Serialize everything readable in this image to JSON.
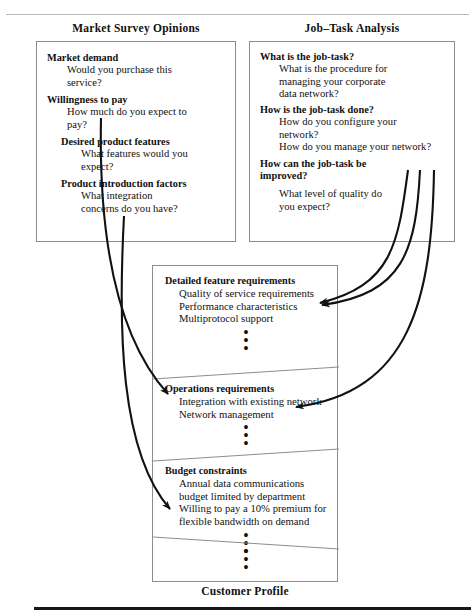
{
  "diagram": {
    "bottom_caption": "Customer Profile",
    "columns": {
      "left_title": "Market Survey Opinions",
      "right_title": "Job–Task Analysis"
    },
    "market_survey": {
      "groups": [
        {
          "heading": "Market demand",
          "detail": "Would you purchase this\nservice?"
        },
        {
          "heading": "Willingness to pay",
          "detail": "How much do you expect to\npay?"
        },
        {
          "heading": "Desired product features",
          "detail": "What features would you\nexpect?"
        },
        {
          "heading": "Product introduction factors",
          "detail": "What integration\nconcerns do you have?"
        }
      ]
    },
    "job_task_analysis": {
      "groups": [
        {
          "heading": "What is the job-task?",
          "detail": "What is the procedure for\nmanaging your corporate\ndata network?"
        },
        {
          "heading": "How is the job-task done?",
          "detail": "How do you configure your\nnetwork?\nHow do you manage your network?"
        },
        {
          "heading": "How can the job-task be\nimproved?",
          "detail": "What level of quality do\nyou expect?"
        }
      ]
    },
    "customer_profile": {
      "sections": [
        {
          "heading": "Detailed feature requirements",
          "items": "Quality of service requirements\nPerformance characteristics\nMultiprotocol support",
          "ellipsis": "•••"
        },
        {
          "heading": "Operations requirements",
          "items": "Integration with existing network\nNetwork management",
          "ellipsis": "•••"
        },
        {
          "heading": "Budget constraints",
          "items": "Annual data communications\nbudget limited by department\nWilling to pay a 10% premium for\nflexible bandwidth on demand",
          "ellipsis": "•••"
        },
        {
          "heading": "",
          "items": "",
          "ellipsis": "•••"
        }
      ]
    },
    "connectors": [
      {
        "name": "market-demand-to-operations",
        "from": "Market Survey Opinions",
        "to": "Integration with existing network"
      },
      {
        "name": "willingness-to-pay-to-budget",
        "from": "Market Survey Opinions",
        "to": "Willing to pay a 10% premium for flexible bandwidth on demand"
      },
      {
        "name": "job-task-to-feature-requirements-a",
        "from": "Job–Task Analysis",
        "to": "Performance characteristics"
      },
      {
        "name": "job-task-to-feature-requirements-b",
        "from": "Job–Task Analysis",
        "to": "Performance characteristics"
      },
      {
        "name": "job-task-to-network-management",
        "from": "Job–Task Analysis",
        "to": "Network management"
      }
    ],
    "colors": {
      "ink": "#111111",
      "box_border": "#8d8d8d",
      "rule_light": "#b9b9b9",
      "rule_dark": "#171717",
      "background": "#ffffff"
    }
  }
}
